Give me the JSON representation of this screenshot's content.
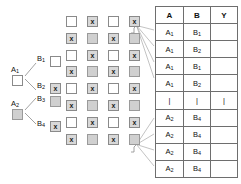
{
  "diagram": {
    "tree": {
      "nodes": [
        {
          "label": "A",
          "sub": "1",
          "state": "unchecked",
          "mark": ""
        },
        {
          "label": "A",
          "sub": "2",
          "state": "grey",
          "mark": ""
        },
        {
          "label": "B",
          "sub": "1",
          "state": "unchecked",
          "mark": ""
        },
        {
          "label": "B",
          "sub": "2",
          "state": "checked",
          "mark": "x"
        },
        {
          "label": "B",
          "sub": "3",
          "state": "grey",
          "mark": ""
        },
        {
          "label": "B",
          "sub": "4",
          "state": "checked",
          "mark": "x"
        }
      ]
    },
    "grid": {
      "columns": 4,
      "rows": 8,
      "cells": [
        [
          "unchecked",
          "checked",
          "unchecked",
          "checked"
        ],
        [
          "checked",
          "grey",
          "checked",
          "grey"
        ],
        [
          "unchecked",
          "checked",
          "unchecked",
          "checked"
        ],
        [
          "checked",
          "grey",
          "checked",
          "grey"
        ],
        [
          "unchecked",
          "checked",
          "unchecked",
          "checked"
        ],
        [
          "checked",
          "grey",
          "checked",
          "grey"
        ],
        [
          "unchecked",
          "checked",
          "unchecked",
          "checked"
        ],
        [
          "checked",
          "grey",
          "checked",
          "grey"
        ]
      ],
      "marks": [
        [
          "",
          "x",
          "",
          "x"
        ],
        [
          "x",
          "",
          "x",
          ""
        ],
        [
          "",
          "x",
          "",
          "x"
        ],
        [
          "x",
          "",
          "x",
          ""
        ],
        [
          "",
          "x",
          "",
          "x"
        ],
        [
          "x",
          "",
          "x",
          ""
        ],
        [
          "",
          "x",
          "",
          "x"
        ],
        [
          "x",
          "",
          "x",
          ""
        ]
      ]
    },
    "brackets": [
      {
        "name": "top-bracket",
        "row": 1
      },
      {
        "name": "bottom-bracket",
        "row": 8
      }
    ],
    "table": {
      "headers": [
        "A",
        "B",
        "Y"
      ],
      "rows": [
        {
          "a": "A",
          "a_sub": "1",
          "b": "B",
          "b_sub": "1",
          "y": ""
        },
        {
          "a": "A",
          "a_sub": "1",
          "b": "B",
          "b_sub": "2",
          "y": ""
        },
        {
          "a": "A",
          "a_sub": "1",
          "b": "B",
          "b_sub": "1",
          "y": ""
        },
        {
          "a": "A",
          "a_sub": "1",
          "b": "B",
          "b_sub": "2",
          "y": ""
        },
        {
          "a": "|",
          "a_sub": "",
          "b": "|",
          "b_sub": "",
          "y": "|"
        },
        {
          "a": "A",
          "a_sub": "2",
          "b": "B",
          "b_sub": "4",
          "y": ""
        },
        {
          "a": "A",
          "a_sub": "2",
          "b": "B",
          "b_sub": "4",
          "y": ""
        },
        {
          "a": "A",
          "a_sub": "2",
          "b": "B",
          "b_sub": "4",
          "y": ""
        },
        {
          "a": "A",
          "a_sub": "2",
          "b": "B",
          "b_sub": "4",
          "y": ""
        }
      ]
    },
    "colors": {
      "line": "#8a8a8a",
      "grey_fill": "#d0d0d0",
      "border": "#6e6e6e",
      "text": "#111111",
      "background": "#ffffff"
    }
  }
}
